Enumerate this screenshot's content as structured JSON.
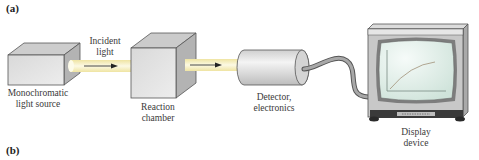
{
  "panels": {
    "a": "(a)",
    "b": "(b)"
  },
  "components": {
    "light_source": {
      "line1": "Monochromatic",
      "line2": "light source"
    },
    "incident_light": {
      "line1": "Incident",
      "line2": "light"
    },
    "reaction_chamber": {
      "line1": "Reaction",
      "line2": "chamber"
    },
    "detector": {
      "line1": "Detector,",
      "line2": "electronics"
    },
    "display": {
      "line1": "Display",
      "line2": "device"
    }
  },
  "colors": {
    "beam": "#f3eab0",
    "beam_core": "#fbf7dd",
    "box_front": "#e2e2e2",
    "box_top": "#cfcfcf",
    "box_side": "#b5b5b5",
    "screen": "#dfeee8",
    "tv_body": "#c9c9c9",
    "outline": "#555555"
  }
}
